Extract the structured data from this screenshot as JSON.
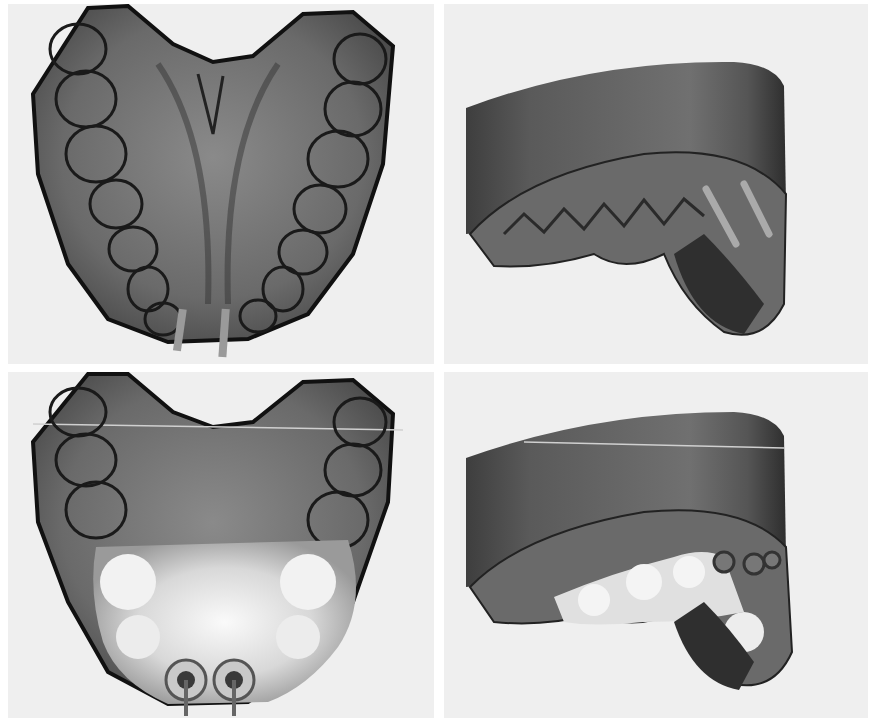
{
  "figure": {
    "label": "B",
    "panels": [
      {
        "id": "top-left",
        "view": "occlusal",
        "state": "before",
        "description": "Maxillary arch scan, occlusal view, two implant posts in anterior region"
      },
      {
        "id": "top-right",
        "view": "oblique-lateral",
        "state": "before",
        "description": "Maxillary cast with base block, oblique view, implant posts visible"
      },
      {
        "id": "bottom-left",
        "view": "occlusal",
        "state": "after",
        "description": "Maxillary arch with designed anterior prosthesis and two implant abutment channels"
      },
      {
        "id": "bottom-right",
        "view": "oblique-lateral",
        "state": "after",
        "description": "Maxillary cast with designed prosthesis, oblique view, screw-access channels visible"
      }
    ],
    "colors": {
      "background": "#ffffff",
      "panel_bg": "#efefef",
      "model_gray": "#6e6e6e",
      "model_dark": "#2a2a2a",
      "outline": "#111111",
      "prosthesis_light": "#e6e6e6",
      "base_block": "#5d5d5d"
    }
  }
}
